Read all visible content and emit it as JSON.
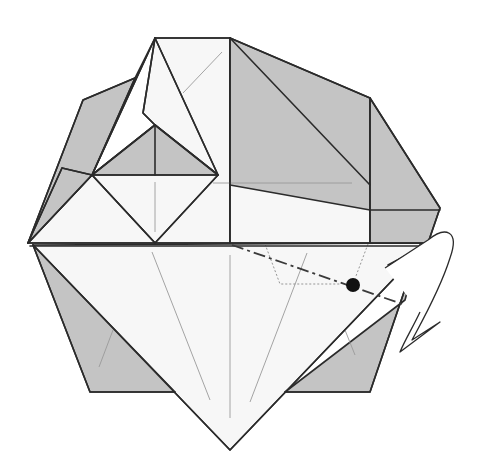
{
  "diagram": {
    "type": "origami-step",
    "colors": {
      "paper_white": "#f7f7f7",
      "paper_gray": "#c4c4c4",
      "line": "#2b2b2b",
      "crease": "#9a9a9a",
      "dot": "#111111"
    },
    "gray_regions": [
      {
        "name": "right-upper-flap",
        "points": "230,38 370,98 370,210 230,185"
      },
      {
        "name": "right-side-flap",
        "points": "370,98 440,208 428,243 370,243"
      },
      {
        "name": "left-upper-flap",
        "points": "83,100 135,78 92,175 28,243"
      },
      {
        "name": "left-lower-small-flap",
        "points": "62,168 92,175 28,243"
      },
      {
        "name": "center-small-triangle",
        "points": "92,175 155,125 218,175"
      },
      {
        "name": "lower-left-flap",
        "points": "33,245 90,392 175,392"
      },
      {
        "name": "lower-right-flap",
        "points": "285,392 370,392 420,245 405,300"
      }
    ],
    "white_regions": [
      {
        "name": "top-square",
        "points": "155,38 230,38 230,243 155,243"
      },
      {
        "name": "upper-right-face",
        "points": "230,38 370,185 370,243 230,243"
      },
      {
        "name": "diamond",
        "points": "92,175 155,243 218,175 155,125"
      },
      {
        "name": "left-kite",
        "points": "155,38 135,78 92,175 28,243 155,243 92,175"
      },
      {
        "name": "upper-kite",
        "points": "155,38 218,175 155,125 143,113"
      },
      {
        "name": "lower-big-triangle",
        "points": "33,245 428,243 230,450"
      }
    ],
    "edges": [
      "M155,38 L230,38",
      "M230,38 L370,98 L440,208 L428,243",
      "M230,38 L370,185",
      "M370,98 L370,243",
      "M370,210 L440,210",
      "M230,38 L230,243",
      "M155,38 L218,175 L155,243 L92,175 L155,125 L218,175",
      "M155,38 L143,113 L155,125",
      "M155,38 L92,175",
      "M92,175 L218,175",
      "M155,125 L155,175",
      "M135,78 L83,100 L28,243",
      "M135,78 L92,175",
      "M62,168 L92,175 L28,243",
      "M62,168 L28,243",
      "M28,243 L428,243",
      "M30,246 L428,246",
      "M33,245 L90,392 L175,392",
      "M33,245 L230,450 L428,243",
      "M285,392 L370,392 L420,245"
    ],
    "creases": [
      "M222,52 L183,93",
      "M155,182 L155,232",
      "M213,183 L352,183",
      "M152,252 L210,400",
      "M230,255 L230,418",
      "M307,253 L250,402",
      "M113,330 L99,367",
      "M345,330 L355,355"
    ],
    "hidden_lines": [
      "M265,244 L280,284 L340,284",
      "M368,244 L356,276"
    ],
    "valley_fold": {
      "path": "M232,245 L405,305",
      "label": "valley fold line"
    },
    "reference_dot": {
      "cx": 353,
      "cy": 285,
      "r": 7
    },
    "arrow": {
      "path": "M385,268 L428,240 C445,226 460,230 450,258 C440,290 420,325 412,340 L440,322 L400,352 C405,340 414,325 420,312",
      "label": "fold-behind arrow"
    },
    "short_line": {
      "path": "M388,265 L420,248"
    }
  }
}
